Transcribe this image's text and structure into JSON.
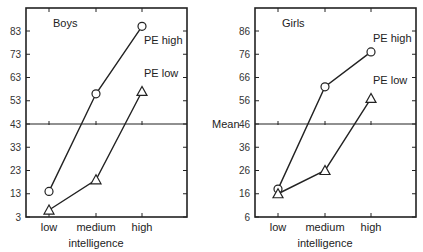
{
  "chart_data": [
    {
      "type": "line",
      "title": "Boys",
      "xlabel": "intelligence",
      "ylabel": "",
      "categories": [
        "low",
        "medium",
        "high"
      ],
      "yticks": [
        3,
        13,
        23,
        33,
        43,
        53,
        63,
        73,
        83
      ],
      "ylim": [
        3,
        93
      ],
      "mean_line": 43,
      "mean_label": "Mean",
      "series": [
        {
          "name": "PE high",
          "marker": "circle",
          "values": [
            14,
            56,
            85
          ]
        },
        {
          "name": "PE low",
          "marker": "triangle",
          "values": [
            6,
            19,
            57
          ]
        }
      ]
    },
    {
      "type": "line",
      "title": "Girls",
      "xlabel": "intelligence",
      "ylabel": "",
      "categories": [
        "low",
        "medium",
        "high"
      ],
      "yticks": [
        6,
        16,
        26,
        36,
        46,
        56,
        66,
        76,
        86
      ],
      "ylim": [
        6,
        96
      ],
      "mean_line": 46,
      "series": [
        {
          "name": "PE high",
          "marker": "circle",
          "values": [
            18,
            62,
            77
          ]
        },
        {
          "name": "PE low",
          "marker": "triangle",
          "values": [
            16,
            26,
            57
          ]
        }
      ]
    }
  ]
}
